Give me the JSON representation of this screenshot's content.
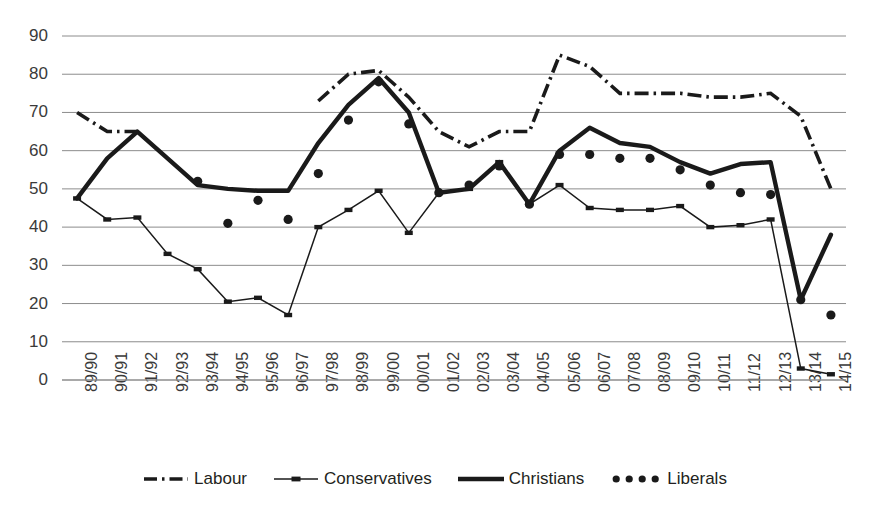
{
  "chart_data": {
    "type": "line",
    "title": "",
    "xlabel": "",
    "ylabel": "",
    "ylim": [
      0,
      90
    ],
    "ytick_step": 10,
    "grid": "horizontal",
    "legend_position": "bottom",
    "categories": [
      "89/90",
      "90/91",
      "91/92",
      "92/93",
      "93/94",
      "94/95",
      "95/96",
      "96/97",
      "97/98",
      "98/99",
      "99/00",
      "00/01",
      "01/02",
      "02/03",
      "03/04",
      "04/05",
      "05/06",
      "06/07",
      "07/08",
      "08/09",
      "09/10",
      "10/11",
      "11/12",
      "12/13",
      "13/14",
      "14/15"
    ],
    "yticks": [
      "0",
      "10",
      "20",
      "30",
      "40",
      "50",
      "60",
      "70",
      "80",
      "90"
    ],
    "series": [
      {
        "name": "Labour",
        "style": "dash-dot",
        "color": "#1a1a1a",
        "values": [
          70,
          65,
          65,
          null,
          51,
          null,
          null,
          null,
          73,
          80,
          81,
          74,
          65,
          61,
          65,
          65,
          85,
          82,
          75,
          75,
          75,
          74,
          74,
          75,
          69,
          50
        ]
      },
      {
        "name": "Conservatives",
        "style": "thin-line-with-square-markers",
        "color": "#1a1a1a",
        "values": [
          47.5,
          42,
          42.5,
          33,
          29,
          20.5,
          21.5,
          17,
          40,
          44.5,
          49.5,
          38.5,
          49,
          50,
          57,
          46,
          51,
          45,
          44.5,
          44.5,
          45.5,
          40,
          40.5,
          42,
          3,
          1.5
        ]
      },
      {
        "name": "Christians",
        "style": "thick-line",
        "color": "#1a1a1a",
        "values": [
          47.5,
          58,
          65,
          58,
          51,
          50,
          49.5,
          49.5,
          62,
          72,
          79,
          70,
          49,
          50,
          57,
          46,
          60,
          66,
          62,
          61,
          57,
          54,
          56.5,
          57,
          21,
          38
        ]
      },
      {
        "name": "Liberals",
        "style": "dotted-markers",
        "color": "#1a1a1a",
        "values": [
          null,
          null,
          null,
          null,
          52,
          41,
          47,
          42,
          54,
          68,
          78,
          67,
          49,
          51,
          56,
          46,
          59,
          59,
          58,
          58,
          55,
          51,
          49,
          48.5,
          21,
          17
        ]
      }
    ]
  },
  "legend": {
    "items": [
      {
        "label": "Labour",
        "icon": "dash-dot-line-swatch"
      },
      {
        "label": "Conservatives",
        "icon": "thin-line-marker-swatch"
      },
      {
        "label": "Christians",
        "icon": "thick-line-swatch"
      },
      {
        "label": "Liberals",
        "icon": "dotted-line-swatch"
      }
    ]
  }
}
